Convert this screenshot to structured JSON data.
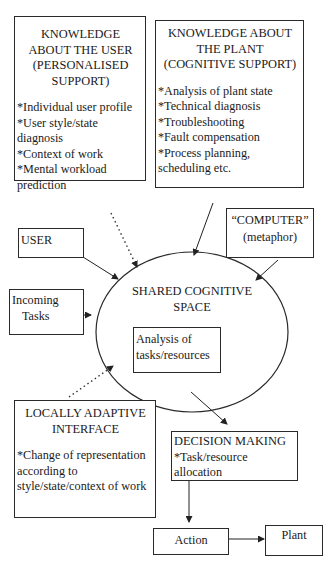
{
  "diagram": {
    "user_knowledge": {
      "title_lines": [
        "KNOWLEDGE",
        "ABOUT THE USER",
        "(PERSONALISED",
        "SUPPORT)"
      ],
      "items": [
        "*Individual user profile",
        "*User style/state",
        "diagnosis",
        "*Context of work",
        "*Mental workload",
        "prediction"
      ]
    },
    "plant_knowledge": {
      "title_lines": [
        "KNOWLEDGE ABOUT",
        "THE PLANT",
        "(COGNITIVE SUPPORT)"
      ],
      "items": [
        "*Analysis of plant state",
        "*Technical diagnosis",
        "*Troubleshooting",
        "*Fault compensation",
        "*Process planning,",
        "scheduling etc."
      ]
    },
    "user": {
      "label": "USER"
    },
    "computer": {
      "line1": "“COMPUTER”",
      "line2": "(metaphor)"
    },
    "incoming_tasks": {
      "line1": "Incoming",
      "line2": "Tasks"
    },
    "shared_space": {
      "line1": "SHARED COGNITIVE",
      "line2": "SPACE"
    },
    "analysis": {
      "line1": "Analysis of",
      "line2": "tasks/resources"
    },
    "adaptive_interface": {
      "title_lines": [
        "LOCALLY ADAPTIVE",
        "INTERFACE"
      ],
      "items": [
        "*Change of representation",
        "according to",
        "style/state/context of work"
      ]
    },
    "decision_making": {
      "title": "DECISION MAKING",
      "items": [
        "*Task/resource",
        "allocation"
      ]
    },
    "action": {
      "label": "Action"
    },
    "plant": {
      "label": "Plant"
    }
  },
  "connections": [
    {
      "from": "user_knowledge",
      "to": "shared_space",
      "style": "dotted"
    },
    {
      "from": "plant_knowledge",
      "to": "shared_space",
      "style": "solid"
    },
    {
      "from": "user",
      "to": "shared_space",
      "style": "solid"
    },
    {
      "from": "computer",
      "to": "shared_space",
      "style": "solid"
    },
    {
      "from": "incoming_tasks",
      "to": "shared_space",
      "style": "solid"
    },
    {
      "from": "adaptive_interface",
      "to": "shared_space",
      "style": "dotted"
    },
    {
      "from": "shared_space",
      "to": "decision_making",
      "style": "solid"
    },
    {
      "from": "decision_making",
      "to": "action",
      "style": "solid"
    },
    {
      "from": "action",
      "to": "plant",
      "style": "solid"
    }
  ]
}
